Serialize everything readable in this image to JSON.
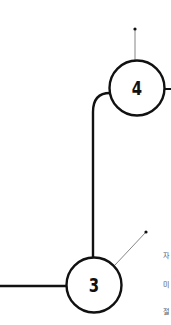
{
  "colors": {
    "stroke": "#111111",
    "thin_line": "#555555",
    "text_muted": "#555555",
    "background": "#ffffff"
  },
  "steps": [
    {
      "number": "4"
    },
    {
      "number": "3"
    }
  ],
  "side_text": [
    {
      "text": "자"
    },
    {
      "text": "미"
    },
    {
      "text": "절"
    }
  ]
}
